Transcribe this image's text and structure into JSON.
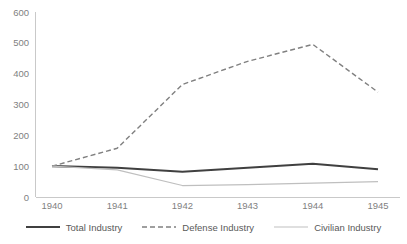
{
  "chart_data": {
    "type": "line",
    "title": "",
    "xlabel": "",
    "ylabel": "",
    "categories": [
      "1940",
      "1941",
      "1942",
      "1943",
      "1944",
      "1945"
    ],
    "x": [
      1940,
      1941,
      1942,
      1943,
      1944,
      1945
    ],
    "ylim": [
      0,
      600
    ],
    "yticks": [
      0,
      100,
      200,
      300,
      400,
      500,
      600
    ],
    "ytick_labels": [
      "0",
      "100",
      "200",
      "300",
      "400",
      "500",
      "600"
    ],
    "grid": false,
    "legend_position": "bottom",
    "series": [
      {
        "name": "Total Industry",
        "values": [
          100,
          95,
          82,
          95,
          108,
          90
        ],
        "color": "#404040",
        "style": "solid",
        "width": 2.1
      },
      {
        "name": "Defense Industry",
        "values": [
          100,
          158,
          365,
          440,
          495,
          340
        ],
        "color": "#808080",
        "style": "dashed",
        "width": 1.4
      },
      {
        "name": "Civilian Industry",
        "values": [
          100,
          88,
          37,
          40,
          45,
          50
        ],
        "color": "#bfbfbf",
        "style": "solid",
        "width": 1.1
      }
    ]
  },
  "axis": {
    "line_color": "#c9c9c9",
    "label_color": "#7f7f7f"
  },
  "legend": {
    "entries": [
      {
        "label": "Total Industry"
      },
      {
        "label": "Defense Industry"
      },
      {
        "label": "Civilian Industry"
      }
    ]
  }
}
